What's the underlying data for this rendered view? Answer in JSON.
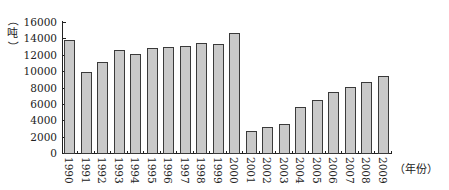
{
  "chart_data": {
    "type": "bar",
    "title": "",
    "xlabel": "（年份）",
    "ylabel": "（吨）",
    "ylim": [
      0,
      16000
    ],
    "yticks": [
      0,
      2000,
      4000,
      6000,
      8000,
      10000,
      12000,
      14000,
      16000
    ],
    "grid": false,
    "legend": null,
    "categories": [
      "1990",
      "1991",
      "1992",
      "1993",
      "1994",
      "1995",
      "1996",
      "1997",
      "1998",
      "1999",
      "2000",
      "2001",
      "2002",
      "2003",
      "2004",
      "2005",
      "2006",
      "2007",
      "2008",
      "2009"
    ],
    "values": [
      13800,
      9900,
      11100,
      12600,
      12100,
      12800,
      13000,
      13100,
      13400,
      13300,
      14600,
      2700,
      3200,
      3600,
      5600,
      6500,
      7400,
      8100,
      8700,
      9400
    ],
    "colors": {
      "bar_fill": "#c9c9c9",
      "bar_edge": "#3a3a3a",
      "axis": "#222222"
    }
  },
  "labels": {
    "ylabel_open": "（",
    "ylabel_unit": "吨",
    "ylabel_close": "）",
    "xlabel": "（年份）"
  }
}
